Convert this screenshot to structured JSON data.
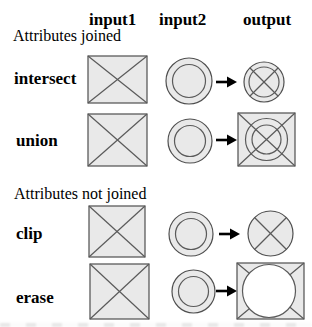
{
  "diagram": {
    "columns": [
      {
        "label": "input1"
      },
      {
        "label": "input2"
      },
      {
        "label": "output"
      }
    ],
    "sections": [
      {
        "label": "Attributes joined",
        "rows": [
          {
            "label": "intersect",
            "input1": "square-with-diagonal-cross",
            "input2": "concentric-circles",
            "output": "circle-with-inner-ring-and-diagonal-cross"
          },
          {
            "label": "union",
            "input1": "square-with-diagonal-cross",
            "input2": "concentric-circles",
            "output": "square-with-diagonal-cross-and-concentric-circles"
          }
        ]
      },
      {
        "label": "Attributes not joined",
        "rows": [
          {
            "label": "clip",
            "input1": "square-with-diagonal-cross",
            "input2": "concentric-circles",
            "output": "circle-with-diagonal-cross"
          },
          {
            "label": "erase",
            "input1": "square-with-diagonal-cross",
            "input2": "concentric-circles",
            "output": "square-with-diagonal-cross-and-white-circle-hole"
          }
        ]
      }
    ],
    "colors": {
      "background": "#ffffff",
      "shape_fill": "#e9e9e9",
      "shape_stroke": "#555555",
      "arrow": "#000000",
      "text": "#000000"
    }
  }
}
